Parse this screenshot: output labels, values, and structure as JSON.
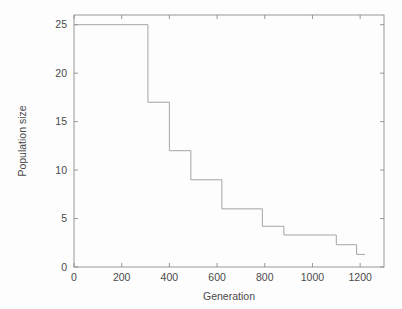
{
  "figure": {
    "background_color": "#fdfdfd",
    "axis_color": "#8c8c8c",
    "line_color": "#9a9a9a",
    "text_color": "#4a4a4a"
  },
  "chart_data": {
    "type": "line",
    "subtype": "step",
    "title": "",
    "subtitle": "",
    "xlabel": "Generation",
    "ylabel": "Population size",
    "xlim": [
      0,
      1300
    ],
    "ylim": [
      0,
      26
    ],
    "grid": false,
    "legend": null,
    "xticks": [
      0,
      200,
      400,
      600,
      800,
      1000,
      1200
    ],
    "xtick_labels": [
      "0",
      "200",
      "400",
      "600",
      "800",
      "1000",
      "1200"
    ],
    "yticks": [
      0,
      5,
      10,
      15,
      20,
      25
    ],
    "ytick_labels": [
      "0",
      "5",
      "10",
      "15",
      "20",
      "25"
    ],
    "annotations": [],
    "series": [
      {
        "name": "Population size",
        "x": [
          0,
          310,
          310,
          400,
          400,
          490,
          490,
          620,
          620,
          790,
          790,
          880,
          880,
          1100,
          1100,
          1185,
          1185,
          1220
        ],
        "y": [
          25,
          25,
          17,
          17,
          12,
          12,
          9,
          9,
          6,
          6,
          4.2,
          4.2,
          3.3,
          3.3,
          2.3,
          2.3,
          1.3,
          1.3
        ],
        "steps": [
          {
            "generation_start": 0,
            "generation_end": 310,
            "population": 25
          },
          {
            "generation_start": 310,
            "generation_end": 400,
            "population": 17
          },
          {
            "generation_start": 400,
            "generation_end": 490,
            "population": 12
          },
          {
            "generation_start": 490,
            "generation_end": 620,
            "population": 9
          },
          {
            "generation_start": 620,
            "generation_end": 790,
            "population": 6
          },
          {
            "generation_start": 790,
            "generation_end": 880,
            "population": 4.2
          },
          {
            "generation_start": 880,
            "generation_end": 1100,
            "population": 3.3
          },
          {
            "generation_start": 1100,
            "generation_end": 1185,
            "population": 2.3
          },
          {
            "generation_start": 1185,
            "generation_end": 1220,
            "population": 1.3
          }
        ]
      }
    ]
  }
}
